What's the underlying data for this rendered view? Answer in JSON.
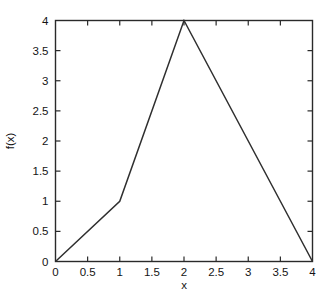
{
  "chart_data": {
    "type": "line",
    "title": "",
    "xlabel": "x",
    "ylabel": "f(x)",
    "xlim": [
      0,
      4
    ],
    "ylim": [
      0,
      4
    ],
    "grid": false,
    "legend": null,
    "x_ticks": [
      0,
      0.5,
      1,
      1.5,
      2,
      2.5,
      3,
      3.5,
      4
    ],
    "x_tick_labels": [
      "0",
      "0.5",
      "1",
      "1.5",
      "2",
      "2.5",
      "3",
      "3.5",
      "4"
    ],
    "y_ticks": [
      0,
      0.5,
      1,
      1.5,
      2,
      2.5,
      3,
      3.5,
      4
    ],
    "y_tick_labels": [
      "0",
      "0.5",
      "1",
      "1.5",
      "2",
      "2.5",
      "3",
      "3.5",
      "4"
    ],
    "series": [
      {
        "name": "f(x)",
        "color": "#2f2f2f",
        "x": [
          0,
          1,
          2,
          4
        ],
        "y": [
          0,
          1,
          4,
          0
        ]
      }
    ],
    "frame_color": "#2a2a2a",
    "background_color": "#ffffff"
  }
}
